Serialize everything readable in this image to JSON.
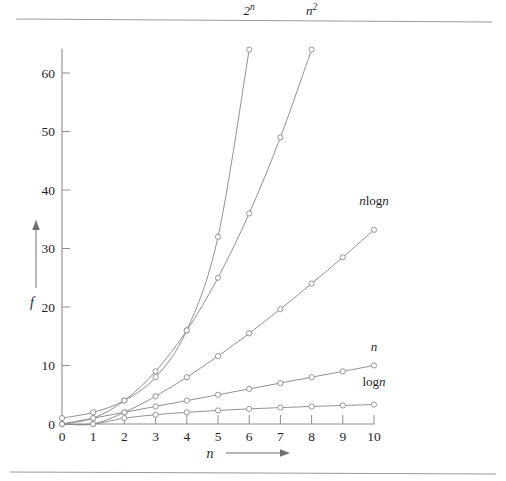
{
  "figure": {
    "background_color": "#ffffff",
    "ink_color": "#8b8b8b",
    "text_color": "#1f1f1f",
    "top_rule": true,
    "bottom_rule": true
  },
  "axes": {
    "x_name": "n",
    "y_name": "f",
    "x_arrow": "right-arrow",
    "y_arrow": "up-arrow",
    "x_ticks": [
      "0",
      "1",
      "2",
      "3",
      "4",
      "5",
      "6",
      "7",
      "8",
      "9",
      "10"
    ],
    "y_ticks": [
      "0",
      "10",
      "20",
      "30",
      "40",
      "50",
      "60"
    ],
    "x_tick_values": [
      0,
      1,
      2,
      3,
      4,
      5,
      6,
      7,
      8,
      9,
      10
    ],
    "y_tick_values": [
      0,
      10,
      20,
      30,
      40,
      50,
      60
    ]
  },
  "chart_data": {
    "type": "line",
    "title": "",
    "subtitle": "",
    "xlabel": "n",
    "ylabel": "f",
    "xlim": [
      0,
      10
    ],
    "ylim": [
      0,
      64
    ],
    "grid": false,
    "legend": "inline-curve-end-labels",
    "marker": "open-circle",
    "x": [
      0,
      1,
      2,
      3,
      4,
      5,
      6,
      7,
      8,
      9,
      10
    ],
    "series": [
      {
        "name": "2^n",
        "label": "2",
        "label_sup": "n",
        "label_kind": "power",
        "x": [
          0,
          1,
          2,
          3,
          4,
          5,
          6
        ],
        "values": [
          1,
          2,
          4,
          8,
          16,
          32,
          64
        ],
        "label_x": 6,
        "label_y": 70
      },
      {
        "name": "n^2",
        "label": "n",
        "label_sup": "2",
        "label_kind": "power",
        "x": [
          0,
          1,
          2,
          3,
          4,
          5,
          6,
          7,
          8
        ],
        "values": [
          0,
          1,
          4,
          9,
          16,
          25,
          36,
          49,
          64
        ],
        "label_x": 8,
        "label_y": 70
      },
      {
        "name": "n log n",
        "label": "nlogn",
        "label_kind": "plain",
        "x": [
          0,
          1,
          2,
          3,
          4,
          5,
          6,
          7,
          8,
          9,
          10
        ],
        "values": [
          0,
          0,
          2,
          4.75,
          8,
          11.6,
          15.5,
          19.65,
          24,
          28.5,
          33.2
        ],
        "label_x": 10,
        "label_y": 37.5
      },
      {
        "name": "n",
        "label": "n",
        "label_kind": "plain",
        "x": [
          0,
          1,
          2,
          3,
          4,
          5,
          6,
          7,
          8,
          9,
          10
        ],
        "values": [
          0,
          1,
          2,
          3,
          4,
          5,
          6,
          7,
          8,
          9,
          10
        ],
        "label_x": 10,
        "label_y": 12.5
      },
      {
        "name": "log n",
        "label": "logn",
        "label_kind": "plain",
        "x": [
          0,
          1,
          2,
          3,
          4,
          5,
          6,
          7,
          8,
          9,
          10
        ],
        "values": [
          0,
          0,
          1,
          1.585,
          2,
          2.322,
          2.585,
          2.807,
          3,
          3.17,
          3.32
        ],
        "label_x": 10,
        "label_y": 6.5
      }
    ]
  }
}
